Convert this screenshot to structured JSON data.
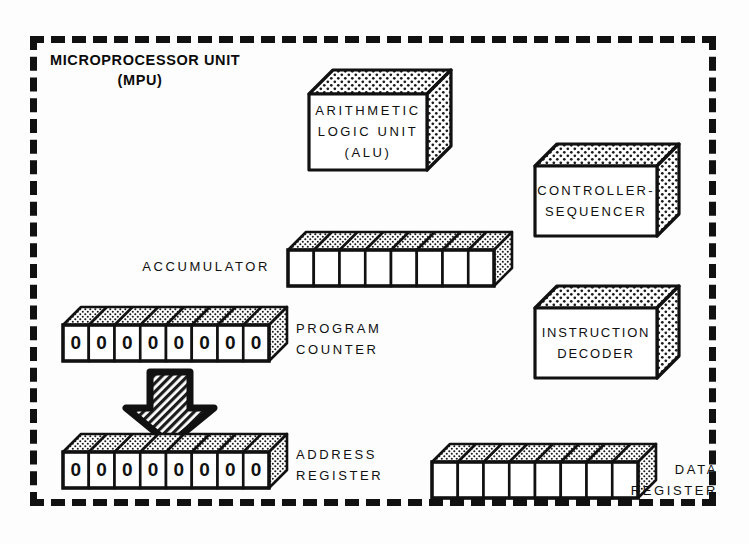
{
  "figure": {
    "boundary_label_line1": "MICROPROCESSOR UNIT",
    "boundary_label_line2": "(MPU)",
    "ink_color": "#111111",
    "paper_color": "#fdfdfd"
  },
  "blocks": [
    {
      "name": "alu",
      "lines": [
        "ARITHMETIC",
        "LOGIC UNIT",
        "(ALU)"
      ]
    },
    {
      "name": "controller-sequencer",
      "lines": [
        "CONTROLLER-",
        "SEQUENCER"
      ]
    },
    {
      "name": "instruction-decoder",
      "lines": [
        "INSTRUCTION",
        "DECODER"
      ]
    }
  ],
  "registers": [
    {
      "name": "accumulator",
      "label_lines": [
        "ACCUMULATOR"
      ],
      "cell_count": 8,
      "cells": [
        "",
        "",
        "",
        "",
        "",
        "",
        "",
        ""
      ]
    },
    {
      "name": "program-counter",
      "label_lines": [
        "PROGRAM",
        "COUNTER"
      ],
      "cell_count": 8,
      "cells": [
        "0",
        "0",
        "0",
        "0",
        "0",
        "0",
        "0",
        "0"
      ]
    },
    {
      "name": "address-register",
      "label_lines": [
        "ADDRESS",
        "REGISTER"
      ],
      "cell_count": 8,
      "cells": [
        "0",
        "0",
        "0",
        "0",
        "0",
        "0",
        "0",
        "0"
      ]
    },
    {
      "name": "data-register",
      "label_lines": [
        "DATA",
        "REGISTER"
      ],
      "cell_count": 8,
      "cells": [
        "",
        "",
        "",
        "",
        "",
        "",
        "",
        ""
      ]
    }
  ],
  "connector": {
    "name": "program-counter-to-address-register-arrow",
    "direction": "down",
    "fill": "diagonal-hatch"
  }
}
